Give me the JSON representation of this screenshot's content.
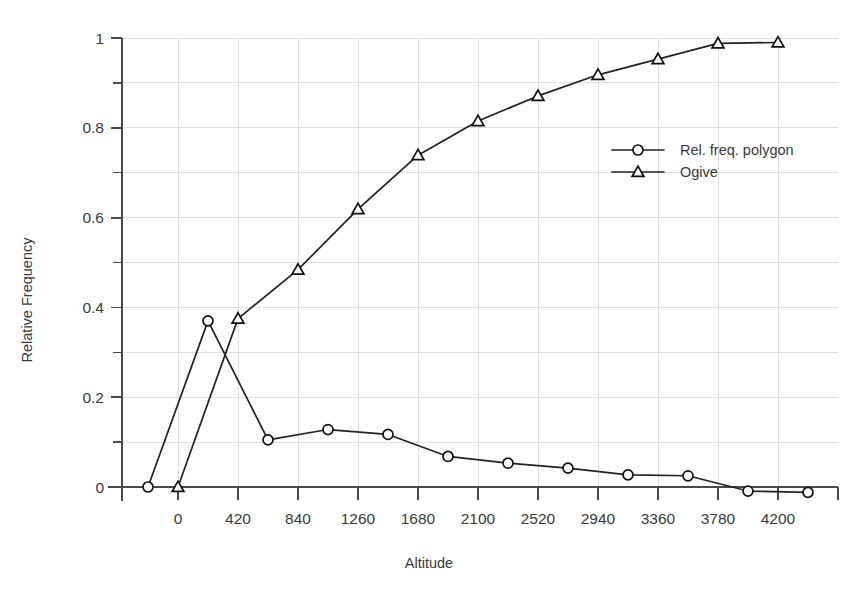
{
  "chart_data": {
    "type": "line",
    "title": "",
    "xlabel": "Altitude",
    "ylabel": "Relative Frequency",
    "xlim": [
      -420,
      4560
    ],
    "ylim": [
      0,
      1
    ],
    "grid": true,
    "legend_position": "right-upper",
    "x_ticks": [
      0,
      420,
      840,
      1260,
      1680,
      2100,
      2520,
      2940,
      3360,
      3780,
      4200
    ],
    "x_tick_labels": [
      "0",
      "420",
      "840",
      "1260",
      "1680",
      "2100",
      "2520",
      "2940",
      "3360",
      "3780",
      "4200"
    ],
    "y_ticks": [
      0,
      0.2,
      0.4,
      0.6,
      0.8,
      1
    ],
    "y_tick_labels": [
      "0",
      "0.2",
      "0.4",
      "0.6",
      "0.8",
      "1"
    ],
    "y_minor_ticks": [
      0.1,
      0.3,
      0.5,
      0.7,
      0.9
    ],
    "series": [
      {
        "name": "Rel. freq. polygon",
        "marker": "circle",
        "points": [
          [
            -210,
            0.0
          ],
          [
            210,
            0.37
          ],
          [
            630,
            0.105
          ],
          [
            1050,
            0.128
          ],
          [
            1470,
            0.117
          ],
          [
            1890,
            0.068
          ],
          [
            2310,
            0.053
          ],
          [
            2730,
            0.042
          ],
          [
            3150,
            0.027
          ],
          [
            3570,
            0.025
          ],
          [
            3990,
            -0.009
          ],
          [
            4410,
            -0.012
          ]
        ]
      },
      {
        "name": "Ogive",
        "marker": "triangle",
        "points": [
          [
            0,
            0.0
          ],
          [
            420,
            0.375
          ],
          [
            840,
            0.484
          ],
          [
            1260,
            0.619
          ],
          [
            1680,
            0.739
          ],
          [
            2100,
            0.815
          ],
          [
            2520,
            0.871
          ],
          [
            2940,
            0.918
          ],
          [
            3360,
            0.953
          ],
          [
            3780,
            0.988
          ],
          [
            4200,
            0.99
          ]
        ]
      }
    ]
  },
  "legend": {
    "entries": [
      {
        "label": "Rel. freq. polygon",
        "marker": "circle"
      },
      {
        "label": "Ogive",
        "marker": "triangle"
      }
    ]
  },
  "colors": {
    "background": "#ffffff",
    "axis": "#4a4a4a",
    "grid": "#dcdcdc",
    "series": "#222222",
    "text": "#3a3a3a"
  }
}
